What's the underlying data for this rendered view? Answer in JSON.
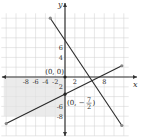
{
  "chart_data": {
    "type": "line",
    "title": "",
    "xlabel": "x",
    "ylabel": "y",
    "xlim": [
      -13,
      14
    ],
    "ylim": [
      -13,
      15
    ],
    "grid": true,
    "x_ticks": [
      -8,
      -6,
      -4,
      -2,
      2,
      8
    ],
    "y_ticks": [
      6,
      4,
      -2,
      -6,
      -8
    ],
    "y_tick_labels": [
      "6",
      "4",
      "2",
      "-6",
      "-8"
    ],
    "x_tick_labels": [
      "-8",
      "-6",
      "-4",
      "-2",
      "2",
      "8"
    ],
    "series": [
      {
        "name": "line-1",
        "slope": -1.5,
        "intercept": 7.5,
        "x_range": [
          -3,
          11.6
        ]
      },
      {
        "name": "line-2",
        "slope": 0.5,
        "intercept": -3.5,
        "x_range": [
          -12,
          11.6
        ]
      }
    ],
    "shaded_region": {
      "description": "region left of y-axis and below x-axis",
      "x_range": [
        -12.5,
        0
      ],
      "y_range": [
        -8,
        0
      ],
      "color": "#e2e2e2"
    },
    "points": [
      {
        "x": 0,
        "y": 0,
        "label": "(0, 0)"
      },
      {
        "x": 0,
        "y": -3.5,
        "label_prefix": "(0, −",
        "numerator": "7",
        "denominator": "2",
        "label_suffix": ")"
      }
    ],
    "colors": {
      "line": "#2a2a2a",
      "grid": "#cfcfcf",
      "axis": "#333333",
      "arrow": "#888888"
    }
  }
}
